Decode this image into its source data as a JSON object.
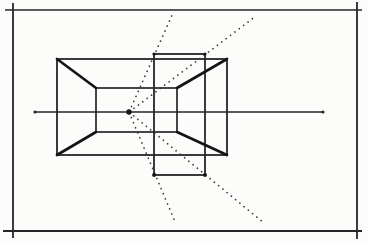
{
  "figure": {
    "canvas": {
      "width": 368,
      "height": 242,
      "paper_color": "#fcfcfb",
      "ink_color": "#262626",
      "heavy_ink_color": "#151515",
      "ray_color": "#3c3c3c"
    },
    "frame_lines": [
      {
        "name": "frame-top",
        "x1": 5,
        "y1": 10,
        "x2": 362,
        "y2": 10,
        "w": 1.7
      },
      {
        "name": "frame-bottom",
        "x1": 3,
        "y1": 231,
        "x2": 362,
        "y2": 231,
        "w": 2.2
      },
      {
        "name": "frame-left",
        "x1": 13,
        "y1": 3,
        "x2": 13,
        "y2": 238,
        "w": 1.8
      },
      {
        "name": "frame-right",
        "x1": 357,
        "y1": 2,
        "x2": 357,
        "y2": 239,
        "w": 1.8
      }
    ],
    "horizon": {
      "name": "horizon-line",
      "x1": 35,
      "y1": 112,
      "x2": 323,
      "y2": 112,
      "w": 1.5
    },
    "horizon_end_dots": [
      {
        "cx": 35,
        "cy": 112,
        "r": 1.6
      },
      {
        "cx": 323,
        "cy": 112,
        "r": 1.6
      }
    ],
    "vanishing_point": {
      "cx": 129,
      "cy": 112,
      "r": 2.7
    },
    "boxes": [
      {
        "name": "front-face-rect",
        "x": 57,
        "y": 59,
        "w": 170,
        "h": 96,
        "sw": 1.8
      },
      {
        "name": "back-face-rect",
        "x": 96,
        "y": 88,
        "w": 81,
        "h": 44,
        "sw": 1.7
      },
      {
        "name": "projected-face-rect",
        "x": 154,
        "y": 54,
        "w": 51,
        "h": 121,
        "sw": 1.8
      }
    ],
    "corner_dots": [
      {
        "cx": 154,
        "cy": 54,
        "r": 1.6
      },
      {
        "cx": 205,
        "cy": 54,
        "r": 1.6
      },
      {
        "cx": 154,
        "cy": 175,
        "r": 1.9
      },
      {
        "cx": 205,
        "cy": 175,
        "r": 1.9
      }
    ],
    "receding_edges": [
      {
        "name": "receding-edge-top-left",
        "x1": 57,
        "y1": 59,
        "x2": 96,
        "y2": 88
      },
      {
        "name": "receding-edge-top-right",
        "x1": 227,
        "y1": 59,
        "x2": 177,
        "y2": 88
      },
      {
        "name": "receding-edge-bottom-left",
        "x1": 57,
        "y1": 155,
        "x2": 96,
        "y2": 132
      },
      {
        "name": "receding-edge-bottom-right",
        "x1": 227,
        "y1": 155,
        "x2": 177,
        "y2": 132
      }
    ],
    "receding_edge_width": 2.7,
    "construction_rays": [
      {
        "name": "construction-ray-upper-left",
        "x1": 131.5,
        "y1": 106.5,
        "x2": 173,
        "y2": 13
      },
      {
        "name": "construction-ray-upper-right",
        "x1": 134,
        "y1": 108.4,
        "x2": 256,
        "y2": 16
      },
      {
        "name": "construction-ray-lower-left",
        "x1": 131.3,
        "y1": 117.6,
        "x2": 176,
        "y2": 224
      },
      {
        "name": "construction-ray-lower-right",
        "x1": 133.6,
        "y1": 115.8,
        "x2": 264,
        "y2": 223
      }
    ],
    "ray_dot_style": {
      "w": 1.7,
      "dash": "0.1 5.4"
    }
  }
}
